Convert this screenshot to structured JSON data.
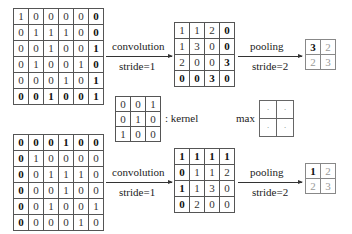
{
  "top": {
    "input": [
      [
        "1",
        "0",
        "0",
        "0",
        "0",
        "0"
      ],
      [
        "0",
        "1",
        "1",
        "1",
        "0",
        "0"
      ],
      [
        "0",
        "0",
        "1",
        "0",
        "0",
        "1"
      ],
      [
        "0",
        "1",
        "0",
        "0",
        "1",
        "0"
      ],
      [
        "0",
        "0",
        "0",
        "1",
        "0",
        "1"
      ],
      [
        "0",
        "0",
        "1",
        "0",
        "0",
        "1"
      ]
    ],
    "conv_label": "convolution",
    "conv_stride": "stride=1",
    "conv_output": [
      [
        "1",
        "1",
        "2",
        "0"
      ],
      [
        "1",
        "3",
        "0",
        "0"
      ],
      [
        "2",
        "0",
        "0",
        "3"
      ],
      [
        "0",
        "0",
        "3",
        "0"
      ]
    ],
    "pool_label": "pooling",
    "pool_stride": "stride=2",
    "pool_output": [
      [
        "3",
        "2"
      ],
      [
        "2",
        "3"
      ]
    ]
  },
  "kernel": {
    "values": [
      [
        "0",
        "0",
        "1"
      ],
      [
        "0",
        "1",
        "0"
      ],
      [
        "1",
        "0",
        "0"
      ]
    ],
    "label": ": kernel"
  },
  "max_op": {
    "label": "max",
    "cells": [
      [
        "·",
        "·"
      ],
      [
        "·",
        "·"
      ]
    ]
  },
  "bottom": {
    "input": [
      [
        "0",
        "0",
        "0",
        "1",
        "0",
        "0"
      ],
      [
        "0",
        "1",
        "0",
        "0",
        "0",
        "0"
      ],
      [
        "0",
        "0",
        "1",
        "1",
        "1",
        "0"
      ],
      [
        "0",
        "0",
        "0",
        "1",
        "0",
        "0"
      ],
      [
        "0",
        "0",
        "1",
        "0",
        "0",
        "1"
      ],
      [
        "0",
        "0",
        "0",
        "0",
        "1",
        "0"
      ]
    ],
    "conv_label": "convolution",
    "conv_stride": "stride=1",
    "conv_output": [
      [
        "1",
        "1",
        "1",
        "1"
      ],
      [
        "0",
        "1",
        "1",
        "2"
      ],
      [
        "1",
        "1",
        "3",
        "0"
      ],
      [
        "0",
        "2",
        "0",
        "0"
      ]
    ],
    "pool_label": "pooling",
    "pool_stride": "stride=2",
    "pool_output": [
      [
        "1",
        "2"
      ],
      [
        "2",
        "3"
      ]
    ]
  }
}
